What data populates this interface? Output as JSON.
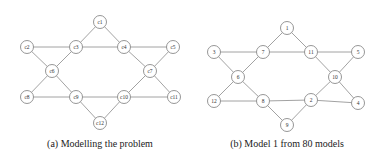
{
  "figures": [
    {
      "id": "a",
      "caption": "(a) Modelling the problem",
      "caption_pos": [
        100,
        138
      ],
      "node_radius": 6.5,
      "nodes": [
        {
          "id": "c1",
          "label": "c1",
          "x": 100,
          "y": 22
        },
        {
          "id": "c2",
          "label": "c2",
          "x": 27,
          "y": 47
        },
        {
          "id": "c3",
          "label": "c3",
          "x": 76,
          "y": 47
        },
        {
          "id": "c4",
          "label": "c4",
          "x": 124,
          "y": 47
        },
        {
          "id": "c5",
          "label": "c5",
          "x": 173,
          "y": 47
        },
        {
          "id": "c6",
          "label": "c6",
          "x": 52,
          "y": 71
        },
        {
          "id": "c7",
          "label": "c7",
          "x": 150,
          "y": 71
        },
        {
          "id": "c8",
          "label": "c8",
          "x": 27,
          "y": 97
        },
        {
          "id": "c9",
          "label": "c9",
          "x": 76,
          "y": 97
        },
        {
          "id": "c10",
          "label": "c10",
          "x": 124,
          "y": 97
        },
        {
          "id": "c11",
          "label": "c11",
          "x": 174,
          "y": 97
        },
        {
          "id": "c12",
          "label": "c12",
          "x": 100,
          "y": 123
        }
      ],
      "edges": [
        [
          "c1",
          "c3"
        ],
        [
          "c1",
          "c4"
        ],
        [
          "c2",
          "c3"
        ],
        [
          "c3",
          "c4"
        ],
        [
          "c4",
          "c5"
        ],
        [
          "c2",
          "c6"
        ],
        [
          "c3",
          "c6"
        ],
        [
          "c4",
          "c7"
        ],
        [
          "c5",
          "c7"
        ],
        [
          "c6",
          "c8"
        ],
        [
          "c6",
          "c9"
        ],
        [
          "c7",
          "c10"
        ],
        [
          "c7",
          "c11"
        ],
        [
          "c8",
          "c9"
        ],
        [
          "c9",
          "c10"
        ],
        [
          "c10",
          "c11"
        ],
        [
          "c9",
          "c12"
        ],
        [
          "c10",
          "c12"
        ]
      ]
    },
    {
      "id": "b",
      "caption": "(b) Model 1 from 80 models",
      "caption_pos": [
        287,
        138
      ],
      "node_radius": 6.5,
      "nodes": [
        {
          "id": "1",
          "label": "1",
          "x": 287,
          "y": 28
        },
        {
          "id": "3",
          "label": "3",
          "x": 214,
          "y": 52
        },
        {
          "id": "7",
          "label": "7",
          "x": 263,
          "y": 52
        },
        {
          "id": "11",
          "label": "11",
          "x": 311,
          "y": 52
        },
        {
          "id": "5",
          "label": "5",
          "x": 358,
          "y": 52
        },
        {
          "id": "6",
          "label": "6",
          "x": 238,
          "y": 77
        },
        {
          "id": "10",
          "label": "10",
          "x": 335,
          "y": 77
        },
        {
          "id": "12",
          "label": "12",
          "x": 214,
          "y": 101
        },
        {
          "id": "8",
          "label": "8",
          "x": 263,
          "y": 101
        },
        {
          "id": "2",
          "label": "2",
          "x": 311,
          "y": 100
        },
        {
          "id": "4",
          "label": "4",
          "x": 358,
          "y": 103
        },
        {
          "id": "9",
          "label": "9",
          "x": 287,
          "y": 125
        }
      ],
      "edges": [
        [
          "1",
          "7"
        ],
        [
          "1",
          "11"
        ],
        [
          "3",
          "7"
        ],
        [
          "7",
          "11"
        ],
        [
          "11",
          "5"
        ],
        [
          "3",
          "6"
        ],
        [
          "7",
          "6"
        ],
        [
          "11",
          "10"
        ],
        [
          "5",
          "10"
        ],
        [
          "6",
          "12"
        ],
        [
          "6",
          "8"
        ],
        [
          "10",
          "2"
        ],
        [
          "10",
          "4"
        ],
        [
          "12",
          "8"
        ],
        [
          "8",
          "2"
        ],
        [
          "2",
          "4"
        ],
        [
          "8",
          "9"
        ],
        [
          "2",
          "9"
        ]
      ]
    }
  ]
}
